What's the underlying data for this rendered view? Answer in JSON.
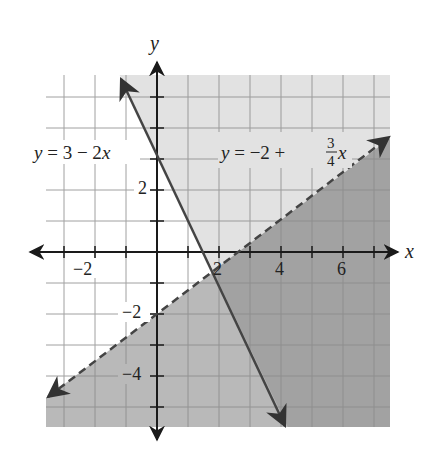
{
  "chart_data": {
    "type": "line",
    "title": "",
    "xlabel": "x",
    "ylabel": "y",
    "xlim": [
      -3.6,
      7.5
    ],
    "ylim": [
      -5.6,
      5.7
    ],
    "grid": true,
    "grid_step": 1,
    "x_tick_labels": [
      {
        "value": -2,
        "label": "−2"
      },
      {
        "value": 2,
        "label": "2"
      },
      {
        "value": 4,
        "label": "4"
      },
      {
        "value": 6,
        "label": "6"
      }
    ],
    "y_tick_labels": [
      {
        "value": 2,
        "label": "2"
      },
      {
        "value": -2,
        "label": "−2"
      },
      {
        "value": -4,
        "label": "−4"
      }
    ],
    "series": [
      {
        "name": "y = 3 − 2x",
        "style": "solid",
        "slope": -2,
        "intercept": 3,
        "x": [
          -1.16,
          4.13
        ],
        "y": [
          5.32,
          -5.26
        ],
        "label": {
          "y": "y",
          "rest": " = 3 − 2",
          "x": "x"
        }
      },
      {
        "name": "y = −2 + (3/4)x",
        "style": "dashed",
        "slope": 0.75,
        "intercept": -2,
        "x": [
          -3.5,
          7.5
        ],
        "y": [
          -4.63,
          3.63
        ],
        "label": {
          "y": "y",
          "rest": " = −2 + ",
          "num": "3",
          "den": "4",
          "x": "x"
        }
      }
    ],
    "shaded_regions": [
      {
        "description": "y > 3 − 2x",
        "color": "#e2e2e2"
      },
      {
        "description": "y < −2 + (3/4)x",
        "color": "#b9b9b9"
      },
      {
        "description": "overlap: y > 3 − 2x and y < −2 + (3/4)x",
        "color": "#a2a2a2"
      }
    ],
    "intersection": {
      "x": 1.82,
      "y": -0.64
    }
  }
}
